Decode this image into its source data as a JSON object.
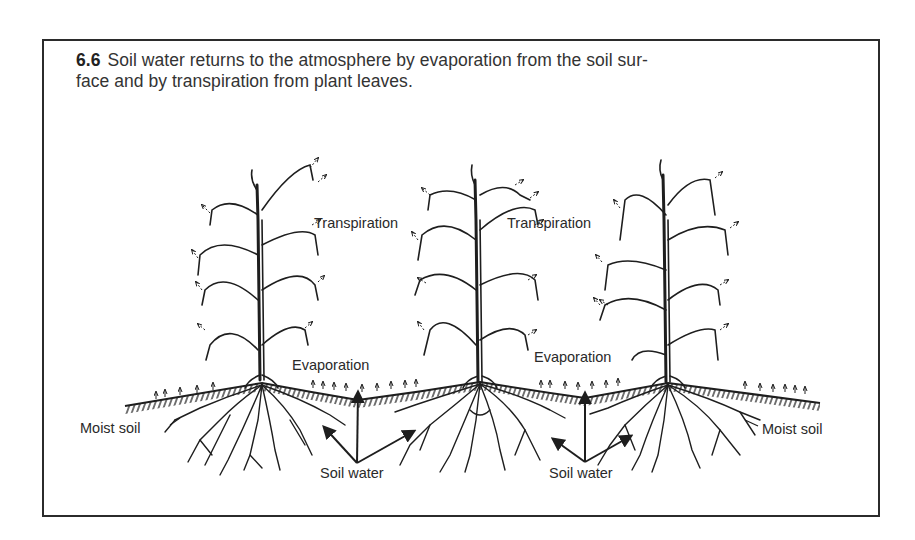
{
  "figure": {
    "number": "6.6",
    "caption_line1": "Soil water returns to the atmosphere by evaporation from the soil sur-",
    "caption_line2": "face and by transpiration from plant leaves."
  },
  "labels": {
    "transpiration_1": "Transpiration",
    "transpiration_2": "Transpiration",
    "evaporation_1": "Evaporation",
    "evaporation_2": "Evaporation",
    "moist_soil_left": "Moist soil",
    "moist_soil_right": "Moist soil",
    "soil_water_1": "Soil water",
    "soil_water_2": "Soil water"
  },
  "colors": {
    "ink": "#1e1e1e",
    "border": "#2b2b2b",
    "background": "#ffffff"
  }
}
